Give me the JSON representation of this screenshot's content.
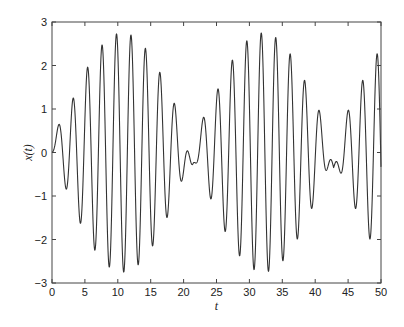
{
  "chart_data": {
    "type": "line",
    "title": "",
    "xlabel": "t",
    "ylabel": "x(t)",
    "xlim": [
      0,
      50
    ],
    "ylim": [
      -3,
      3
    ],
    "x_ticks": [
      0,
      5,
      10,
      15,
      20,
      25,
      30,
      35,
      40,
      45,
      50
    ],
    "y_ticks": [
      -3,
      -2,
      -1,
      0,
      1,
      2,
      3
    ],
    "x_tick_labels": [
      "0",
      "5",
      "10",
      "15",
      "20",
      "25",
      "30",
      "35",
      "40",
      "45",
      "50"
    ],
    "y_tick_labels": [
      "−3",
      "−2",
      "−1",
      "0",
      "1",
      "2",
      "3"
    ],
    "grid": false,
    "legend": null,
    "line_color": "#333333",
    "model": {
      "fast_omega": 2.856,
      "fast_phase": 1.29,
      "envelope_amplitude": 2.75,
      "envelope_half_period": 21.4,
      "wiggle_amplitude": 0.35
    },
    "series": [
      {
        "name": "x(t)",
        "extrema": [
          {
            "t": 0.9,
            "x": 0.45
          },
          {
            "t": 2.1,
            "x": -0.9
          },
          {
            "t": 3.2,
            "x": 1.3
          },
          {
            "t": 4.3,
            "x": -1.7
          },
          {
            "t": 5.4,
            "x": 2.0
          },
          {
            "t": 6.5,
            "x": -2.3
          },
          {
            "t": 7.6,
            "x": 2.5
          },
          {
            "t": 8.7,
            "x": -2.7
          },
          {
            "t": 9.8,
            "x": 2.75
          },
          {
            "t": 11.0,
            "x": -2.8
          },
          {
            "t": 12.0,
            "x": 2.7
          },
          {
            "t": 13.2,
            "x": -2.55
          },
          {
            "t": 14.3,
            "x": 2.3
          },
          {
            "t": 15.4,
            "x": -2.05
          },
          {
            "t": 16.5,
            "x": 1.7
          },
          {
            "t": 17.6,
            "x": -1.35
          },
          {
            "t": 18.7,
            "x": 0.9
          },
          {
            "t": 19.8,
            "x": -0.45
          },
          {
            "t": 21.6,
            "x": 0.45
          },
          {
            "t": 23.0,
            "x": -0.9
          },
          {
            "t": 24.1,
            "x": 1.3
          },
          {
            "t": 25.3,
            "x": -1.7
          },
          {
            "t": 26.4,
            "x": 2.0
          },
          {
            "t": 27.6,
            "x": -2.3
          },
          {
            "t": 28.5,
            "x": 2.5
          },
          {
            "t": 29.8,
            "x": -2.7
          },
          {
            "t": 30.9,
            "x": 2.75
          },
          {
            "t": 32.0,
            "x": -2.8
          },
          {
            "t": 33.0,
            "x": 2.7
          },
          {
            "t": 34.2,
            "x": -2.55
          },
          {
            "t": 35.2,
            "x": 2.3
          },
          {
            "t": 36.4,
            "x": -2.05
          },
          {
            "t": 37.4,
            "x": 1.7
          },
          {
            "t": 38.6,
            "x": -1.35
          },
          {
            "t": 39.7,
            "x": 0.9
          },
          {
            "t": 40.8,
            "x": -0.45
          },
          {
            "t": 42.6,
            "x": 0.45
          },
          {
            "t": 44.1,
            "x": -0.9
          },
          {
            "t": 45.2,
            "x": 1.3
          },
          {
            "t": 46.3,
            "x": -1.7
          },
          {
            "t": 47.4,
            "x": 2.0
          },
          {
            "t": 48.5,
            "x": -2.3
          },
          {
            "t": 49.6,
            "x": 2.5
          }
        ]
      }
    ]
  },
  "plot_area": {
    "left": 52,
    "top": 22,
    "right": 381,
    "bottom": 283
  }
}
